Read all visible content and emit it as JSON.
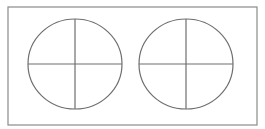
{
  "diagram": {
    "frame": {
      "x": 8,
      "y": 7,
      "width": 249,
      "height": 118,
      "stroke": "#8a8a8a"
    },
    "stroke_color": "#6e6e6e",
    "shapes": [
      {
        "type": "circle-with-cross",
        "cx": 75,
        "cy": 64,
        "rx": 47,
        "ry": 45
      },
      {
        "type": "circle-with-cross",
        "cx": 186,
        "cy": 64,
        "rx": 47,
        "ry": 45
      }
    ]
  }
}
